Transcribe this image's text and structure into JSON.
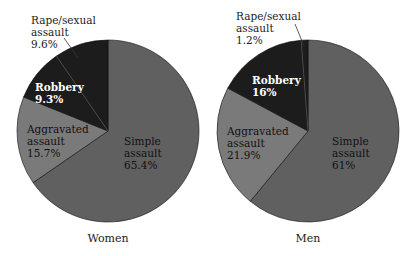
{
  "chart_data": [
    {
      "type": "pie",
      "title": "Women",
      "start_angle": "12 o'clock, clockwise",
      "categories": [
        "Simple assault",
        "Aggravated assault",
        "Robbery",
        "Rape/sexual assault"
      ],
      "values": [
        65.4,
        15.7,
        9.3,
        9.6
      ],
      "labels": [
        "65.4%",
        "15.7%",
        "9.3%",
        "9.6%"
      ],
      "colors": [
        "#606060",
        "#7a7a7a",
        "#1c1c1c",
        "#1c1c1c"
      ],
      "legend": "none (direct labels)"
    },
    {
      "type": "pie",
      "title": "Men",
      "start_angle": "12 o'clock, clockwise",
      "categories": [
        "Simple assault",
        "Aggravated assault",
        "Robbery",
        "Rape/sexual assault"
      ],
      "values": [
        61,
        21.9,
        16,
        1.2
      ],
      "labels": [
        "61%",
        "21.9%",
        "16%",
        "1.2%"
      ],
      "colors": [
        "#606060",
        "#7a7a7a",
        "#1c1c1c",
        "#1c1c1c"
      ],
      "legend": "none (direct labels)"
    }
  ],
  "pies": [
    {
      "caption": "Women",
      "cx": 108,
      "cy": 131,
      "r": 91,
      "labels": {
        "rape_l1": "Rape/sexual",
        "rape_l2": "assault",
        "rape_pct": "9.6%",
        "robbery": "Robbery",
        "robbery_pct": "9.3%",
        "aggr_l1": "Aggravated",
        "aggr_l2": "assault",
        "aggr_pct": "15.7%",
        "simple_l1": "Simple",
        "simple_l2": "assault",
        "simple_pct": "65.4%"
      }
    },
    {
      "caption": "Men",
      "cx": 308,
      "cy": 131,
      "r": 91,
      "labels": {
        "rape_l1": "Rape/sexual",
        "rape_l2": "assault",
        "rape_pct": "1.2%",
        "robbery": "Robbery",
        "robbery_pct": "16%",
        "aggr_l1": "Aggravated",
        "aggr_l2": "assault",
        "aggr_pct": "21.9%",
        "simple_l1": "Simple",
        "simple_l2": "assault",
        "simple_pct": "61%"
      }
    }
  ]
}
